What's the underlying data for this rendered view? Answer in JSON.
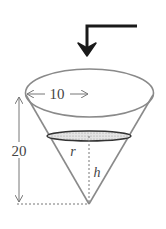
{
  "diagram": {
    "type": "conical-tank",
    "labels": {
      "radius_top": "10",
      "height_total": "20",
      "water_radius": "r",
      "water_height": "h"
    },
    "colors": {
      "stroke": "#888888",
      "arrow": "#1a1a1a",
      "water_fill": "#cfcfcf",
      "dash": "#777777"
    },
    "elements": [
      "inflow-arrow",
      "cone-rim-ellipse",
      "cone-sides",
      "water-surface-ellipse",
      "radius-dimension-arrow",
      "height-dimension-arrow",
      "water-height-dashed-line",
      "baseline-dashed-line"
    ]
  }
}
